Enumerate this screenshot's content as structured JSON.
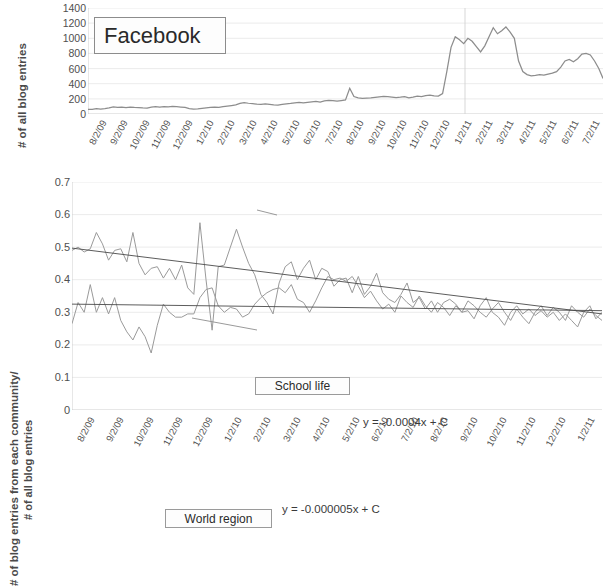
{
  "figure": {
    "background": "#ffffff",
    "line_color": "#8d8d8d",
    "grid_color": "#e6e6e6"
  },
  "top": {
    "ytitle": "# of all blog entries",
    "callout": "Facebook",
    "yticks": [
      "1400",
      "1200",
      "1000",
      "800",
      "600",
      "400",
      "200",
      "0"
    ],
    "xticks": [
      "8/2/09",
      "9/2/09",
      "10/2/09",
      "11/2/09",
      "12/2/09",
      "1/2/10",
      "2/2/10",
      "3/2/10",
      "4/2/10",
      "5/2/10",
      "6/2/10",
      "7/2/10",
      "8/2/10",
      "9/2/10",
      "10/2/10",
      "11/2/10",
      "12/2/10",
      "1/2/11",
      "2/2/11",
      "3/2/11",
      "4/2/11",
      "5/2/11",
      "6/2/11",
      "7/2/11"
    ]
  },
  "bottom": {
    "ytitle_line1": "# of blog entries from each community/",
    "ytitle_line2": "# of all blog entries",
    "callout_school": "School life",
    "callout_world": "World region",
    "eq_school": "y = -0.0004x + C",
    "eq_world": "y = -0.000005x + C",
    "yticks": [
      "0.7",
      "0.6",
      "0.5",
      "0.4",
      "0.3",
      "0.2",
      "0.1",
      "0"
    ],
    "xticks": [
      "8/2/09",
      "9/2/09",
      "10/2/09",
      "11/2/09",
      "12/2/09",
      "1/2/10",
      "2/2/10",
      "3/2/10",
      "4/2/10",
      "5/2/10",
      "6/2/10",
      "7/2/10",
      "8/2/10",
      "9/2/10",
      "10/2/10",
      "11/2/10",
      "12/2/10",
      "1/2/11"
    ]
  },
  "chart_data": [
    {
      "type": "line",
      "title": "Facebook",
      "xlabel": "",
      "ylabel": "# of all blog entries",
      "ylim": [
        0,
        1400
      ],
      "ytick_step": 200,
      "grid": true,
      "legend": "none",
      "categories": [
        "8/2/09",
        "9/2/09",
        "10/2/09",
        "11/2/09",
        "12/2/09",
        "1/2/10",
        "2/2/10",
        "3/2/10",
        "4/2/10",
        "5/2/10",
        "6/2/10",
        "7/2/10",
        "8/2/10",
        "9/2/10",
        "10/2/10",
        "11/2/10",
        "12/2/10",
        "1/2/11",
        "2/2/11",
        "3/2/11",
        "4/2/11",
        "5/2/11",
        "6/2/11",
        "7/2/11"
      ],
      "series": [
        {
          "name": "Facebook blog entries",
          "values": [
            60,
            62,
            70,
            66,
            72,
            80,
            95,
            88,
            92,
            85,
            90,
            86,
            84,
            80,
            78,
            90,
            96,
            92,
            98,
            94,
            100,
            96,
            92,
            88,
            70,
            64,
            68,
            74,
            80,
            86,
            92,
            88,
            96,
            104,
            112,
            120,
            140,
            150,
            142,
            136,
            130,
            126,
            134,
            128,
            122,
            118,
            126,
            134,
            140,
            148,
            152,
            146,
            154,
            160,
            166,
            158,
            172,
            180,
            176,
            170,
            178,
            186,
            340,
            230,
            212,
            206,
            210,
            214,
            220,
            226,
            232,
            228,
            224,
            216,
            222,
            230,
            214,
            224,
            236,
            230,
            244,
            250,
            240,
            236,
            270,
            560,
            880,
            1020,
            980,
            930,
            1000,
            960,
            890,
            820,
            900,
            1020,
            1140,
            1060,
            1100,
            1150,
            1080,
            1000,
            700,
            560,
            520,
            505,
            510,
            520,
            515,
            528,
            540,
            560,
            620,
            700,
            720,
            690,
            730,
            790,
            800,
            780,
            700,
            600,
            470
          ]
        }
      ]
    },
    {
      "type": "line",
      "title": "",
      "xlabel": "",
      "ylabel": "# of blog entries from each community/ # of all blog entries",
      "ylim": [
        0,
        0.7
      ],
      "ytick_step": 0.1,
      "grid": true,
      "legend": "callouts",
      "annotations": [
        {
          "text": "School life",
          "kind": "callout"
        },
        {
          "text": "World region",
          "kind": "callout"
        },
        {
          "text": "y = -0.0004x + C",
          "kind": "trendline-equation",
          "series": "School life",
          "slope": -0.0004
        },
        {
          "text": "y = -0.000005x + C",
          "kind": "trendline-equation",
          "series": "World region",
          "slope": -5e-06
        }
      ],
      "categories": [
        "8/2/09",
        "9/2/09",
        "10/2/09",
        "11/2/09",
        "12/2/09",
        "1/2/10",
        "2/2/10",
        "3/2/10",
        "4/2/10",
        "5/2/10",
        "6/2/10",
        "7/2/10",
        "8/2/10",
        "9/2/10",
        "10/2/10",
        "11/2/10",
        "12/2/10",
        "1/2/11"
      ],
      "series": [
        {
          "name": "School life",
          "values": [
            0.49,
            0.5,
            0.485,
            0.495,
            0.545,
            0.51,
            0.46,
            0.49,
            0.495,
            0.455,
            0.545,
            0.45,
            0.415,
            0.435,
            0.44,
            0.405,
            0.435,
            0.4,
            0.445,
            0.375,
            0.355,
            0.575,
            0.4,
            0.245,
            0.44,
            0.445,
            0.5,
            0.555,
            0.5,
            0.45,
            0.415,
            0.355,
            0.33,
            0.295,
            0.39,
            0.44,
            0.455,
            0.4,
            0.435,
            0.46,
            0.4,
            0.435,
            0.425,
            0.38,
            0.4,
            0.405,
            0.36,
            0.41,
            0.355,
            0.38,
            0.42,
            0.36,
            0.34,
            0.33,
            0.355,
            0.39,
            0.33,
            0.345,
            0.31,
            0.335,
            0.3,
            0.33,
            0.34,
            0.325,
            0.3,
            0.305,
            0.28,
            0.32,
            0.345,
            0.3,
            0.285,
            0.26,
            0.3,
            0.32,
            0.295,
            0.31,
            0.29,
            0.305,
            0.285,
            0.3,
            0.275,
            0.295,
            0.275,
            0.255,
            0.3,
            0.32,
            0.28,
            0.3
          ]
        },
        {
          "name": "World region",
          "values": [
            0.265,
            0.33,
            0.3,
            0.385,
            0.3,
            0.345,
            0.295,
            0.345,
            0.275,
            0.24,
            0.215,
            0.255,
            0.225,
            0.175,
            0.26,
            0.325,
            0.3,
            0.285,
            0.285,
            0.295,
            0.295,
            0.345,
            0.37,
            0.375,
            0.32,
            0.3,
            0.315,
            0.31,
            0.285,
            0.295,
            0.325,
            0.345,
            0.36,
            0.37,
            0.375,
            0.36,
            0.385,
            0.34,
            0.33,
            0.3,
            0.335,
            0.375,
            0.41,
            0.4,
            0.405,
            0.395,
            0.41,
            0.38,
            0.345,
            0.365,
            0.335,
            0.31,
            0.325,
            0.3,
            0.35,
            0.33,
            0.315,
            0.35,
            0.32,
            0.3,
            0.33,
            0.315,
            0.29,
            0.32,
            0.3,
            0.335,
            0.32,
            0.3,
            0.285,
            0.31,
            0.33,
            0.3,
            0.275,
            0.31,
            0.285,
            0.265,
            0.3,
            0.32,
            0.29,
            0.315,
            0.3,
            0.275,
            0.32,
            0.3,
            0.285,
            0.31,
            0.29,
            0.275
          ]
        }
      ],
      "trendlines": [
        {
          "name": "School life trend",
          "y_start": 0.497,
          "y_end": 0.295,
          "equation": "y = -0.0004x + C"
        },
        {
          "name": "World region trend",
          "y_start": 0.325,
          "y_end": 0.305,
          "equation": "y = -0.000005x + C"
        }
      ]
    }
  ]
}
